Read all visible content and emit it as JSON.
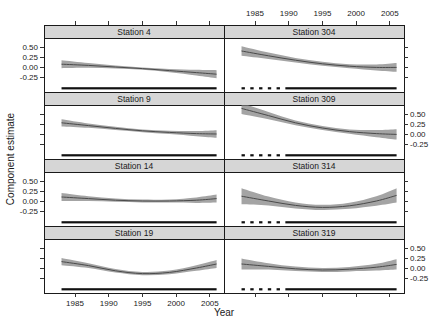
{
  "figure": {
    "ylabel": "Component estimate",
    "xlabel": "Year"
  },
  "colors": {
    "background": "#ffffff",
    "band": "#a4a4a4",
    "fit_line": "#4a4a4a",
    "strip_bg": "#d6d6d6",
    "strip_border": "#1a1a1a",
    "panel_border": "#1a1a1a",
    "panel_bg": "#ffffff",
    "rug": "#111111",
    "tick": "#333333",
    "text": "#1a1a1a"
  },
  "chart_data": {
    "type": "area",
    "title": "",
    "xlabel": "Year",
    "ylabel": "Component estimate",
    "layout": "trellis 4 rows x 2 cols, shared scales, alternating axis labels",
    "x_domain": [
      1980.4,
      2007.1
    ],
    "y_domain": [
      -0.625,
      0.725
    ],
    "x_ticks": {
      "values": [
        1985,
        1990,
        1995,
        2000,
        2005
      ],
      "labels": [
        "1985",
        "1990",
        "1995",
        "2000",
        "2005"
      ]
    },
    "y_ticks": {
      "values": [
        0.5,
        0.25,
        0,
        -0.25
      ],
      "labels": [
        "0.50",
        "0.25",
        "0.00",
        "-0.25"
      ]
    },
    "x_labels_top_col": 1,
    "x_labels_bottom_col": 0,
    "y_label_sides_by_row": [
      "left",
      "right",
      "left",
      "right"
    ],
    "x": [
      1983,
      1987,
      1991,
      1995,
      1999,
      2003,
      2006
    ],
    "panels": [
      {
        "station": "Station 4",
        "row": 0,
        "col": 0,
        "fit": [
          0.07,
          0.04,
          0.0,
          -0.04,
          -0.09,
          -0.14,
          -0.18
        ],
        "half_width": [
          0.1,
          0.06,
          0.035,
          0.03,
          0.04,
          0.07,
          0.1
        ],
        "rug_segments": [
          [
            1983,
            2006
          ]
        ]
      },
      {
        "station": "Station 304",
        "row": 0,
        "col": 1,
        "fit": [
          0.4,
          0.28,
          0.17,
          0.08,
          0.02,
          -0.01,
          -0.01
        ],
        "half_width": [
          0.12,
          0.08,
          0.055,
          0.05,
          0.05,
          0.075,
          0.11
        ],
        "rug_segments": [
          [
            1983,
            1983.5
          ],
          [
            1984.3,
            1984.8
          ],
          [
            1985.6,
            1986.1
          ],
          [
            1986.9,
            1987.4
          ],
          [
            1988.2,
            1988.7
          ],
          [
            1989.5,
            2006
          ]
        ]
      },
      {
        "station": "Station 9",
        "row": 1,
        "col": 0,
        "fit": [
          0.28,
          0.21,
          0.14,
          0.08,
          0.04,
          0.01,
          0.0
        ],
        "half_width": [
          0.09,
          0.055,
          0.04,
          0.035,
          0.04,
          0.065,
          0.095
        ],
        "rug_segments": [
          [
            1983,
            2006
          ]
        ]
      },
      {
        "station": "Station 309",
        "row": 1,
        "col": 1,
        "fit": [
          0.64,
          0.46,
          0.28,
          0.15,
          0.06,
          0.01,
          -0.01
        ],
        "half_width": [
          0.14,
          0.09,
          0.06,
          0.05,
          0.055,
          0.09,
          0.13
        ],
        "rug_segments": [
          [
            1983,
            1983.5
          ],
          [
            1984.3,
            1984.8
          ],
          [
            1985.6,
            1986.1
          ],
          [
            1986.9,
            1987.4
          ],
          [
            1988.2,
            1988.7
          ],
          [
            1989.5,
            2006
          ]
        ]
      },
      {
        "station": "Station 14",
        "row": 2,
        "col": 0,
        "fit": [
          0.1,
          0.06,
          0.02,
          0.0,
          0.0,
          0.02,
          0.06
        ],
        "half_width": [
          0.1,
          0.06,
          0.04,
          0.035,
          0.04,
          0.07,
          0.1
        ],
        "rug_segments": [
          [
            1983,
            2006
          ]
        ]
      },
      {
        "station": "Station 314",
        "row": 2,
        "col": 1,
        "fit": [
          0.12,
          0.0,
          -0.11,
          -0.16,
          -0.12,
          0.0,
          0.14
        ],
        "half_width": [
          0.2,
          0.11,
          0.075,
          0.065,
          0.075,
          0.12,
          0.18
        ],
        "rug_segments": [
          [
            1983,
            1983.5
          ],
          [
            1984.3,
            1984.8
          ],
          [
            1985.6,
            1986.1
          ],
          [
            1986.9,
            1987.4
          ],
          [
            1988.2,
            1988.7
          ],
          [
            1989.5,
            2006
          ]
        ]
      },
      {
        "station": "Station 19",
        "row": 3,
        "col": 0,
        "fit": [
          0.16,
          0.06,
          -0.07,
          -0.14,
          -0.11,
          0.0,
          0.1
        ],
        "half_width": [
          0.09,
          0.06,
          0.045,
          0.04,
          0.045,
          0.07,
          0.1
        ],
        "rug_segments": [
          [
            1983,
            2006
          ]
        ]
      },
      {
        "station": "Station 319",
        "row": 3,
        "col": 1,
        "fit": [
          0.1,
          0.04,
          -0.02,
          -0.05,
          -0.03,
          0.02,
          0.09
        ],
        "half_width": [
          0.14,
          0.08,
          0.055,
          0.05,
          0.055,
          0.085,
          0.13
        ],
        "rug_segments": [
          [
            1983,
            1983.5
          ],
          [
            1984.3,
            1984.8
          ],
          [
            1985.6,
            1986.1
          ],
          [
            1986.9,
            1987.4
          ],
          [
            1988.2,
            1988.7
          ],
          [
            1989.5,
            2006
          ]
        ]
      }
    ]
  }
}
